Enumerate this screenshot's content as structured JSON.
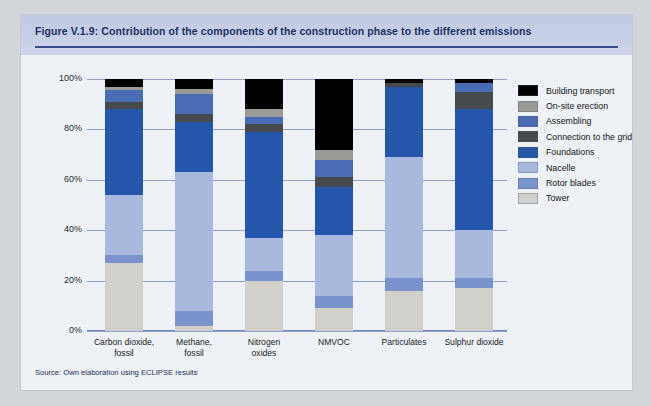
{
  "figure": {
    "title": "Figure V.1.9: Contribution of the components of the construction phase to the different emissions",
    "source": "Source: Own elaboration using ECLIPSE results"
  },
  "colors": {
    "building_transport": "#000000",
    "onsite_erection": "#9a9a96",
    "assembling": "#4a6cb5",
    "connection_to_grid": "#464a4c",
    "foundations": "#2456ab",
    "nacelle": "#a9b9dd",
    "rotor_blades": "#7b93cd",
    "tower": "#d2d0ca",
    "title_text": "#1d2f63",
    "title_band": "#c7cfe6",
    "rule": "#3a4d86",
    "plot_bg": "#eef2f7",
    "gridline": "#6f86b8"
  },
  "legend": {
    "position": "right",
    "items": [
      {
        "label": "Building transport",
        "key": "building_transport",
        "color": "#000000"
      },
      {
        "label": "On-site erection",
        "key": "onsite_erection",
        "color": "#9a9a96"
      },
      {
        "label": "Assembling",
        "key": "assembling",
        "color": "#4a6cb5"
      },
      {
        "label": "Connection to the grid",
        "key": "connection_to_grid",
        "color": "#464a4c"
      },
      {
        "label": "Foundations",
        "key": "foundations",
        "color": "#2456ab"
      },
      {
        "label": "Nacelle",
        "key": "nacelle",
        "color": "#a9b9dd"
      },
      {
        "label": "Rotor blades",
        "key": "rotor_blades",
        "color": "#7b93cd"
      },
      {
        "label": "Tower",
        "key": "tower",
        "color": "#d2d0ca"
      }
    ]
  },
  "axis": {
    "y_ticks": [
      "0%",
      "20%",
      "40%",
      "60%",
      "80%",
      "100%"
    ],
    "y_min": 0,
    "y_max": 100
  },
  "chart_data": {
    "type": "bar",
    "stacked": true,
    "title": "Figure V.1.9: Contribution of the components of the construction phase to the different emissions",
    "xlabel": "",
    "ylabel": "",
    "ylim": [
      0,
      100
    ],
    "grid": true,
    "legend_position": "right",
    "unit": "%",
    "categories": [
      "Carbon dioxide, fossil",
      "Methane, fossil",
      "Nitrogen oxides",
      "NMVOC",
      "Particulates",
      "Sulphur dioxide"
    ],
    "category_lines": [
      [
        "Carbon dioxide,",
        "fossil"
      ],
      [
        "Methane,",
        "fossil"
      ],
      [
        "Nitrogen",
        "oxides"
      ],
      [
        "NMVOC",
        ""
      ],
      [
        "Particulates",
        ""
      ],
      [
        "Sulphur dioxide",
        ""
      ]
    ],
    "series": [
      {
        "name": "Tower",
        "color": "#d2d0ca",
        "values": [
          27,
          2,
          20,
          9,
          16,
          17
        ]
      },
      {
        "name": "Rotor blades",
        "color": "#7b93cd",
        "values": [
          3,
          6,
          4,
          5,
          5,
          4
        ]
      },
      {
        "name": "Nacelle",
        "color": "#a9b9dd",
        "values": [
          24,
          55,
          13,
          24,
          48,
          19
        ]
      },
      {
        "name": "Foundations",
        "color": "#2456ab",
        "values": [
          34,
          20,
          42,
          19,
          28,
          48
        ]
      },
      {
        "name": "Connection to the grid",
        "color": "#464a4c",
        "values": [
          3,
          3,
          3,
          4,
          1.5,
          7
        ]
      },
      {
        "name": "Assembling",
        "color": "#4a6cb5",
        "values": [
          4.5,
          8,
          3,
          7,
          0,
          3.5
        ]
      },
      {
        "name": "On-site erection",
        "color": "#9a9a96",
        "values": [
          1.5,
          2,
          3,
          4,
          0,
          0
        ]
      },
      {
        "name": "Building transport",
        "color": "#000000",
        "values": [
          3,
          4,
          12,
          28,
          1.5,
          1.5
        ]
      }
    ]
  }
}
